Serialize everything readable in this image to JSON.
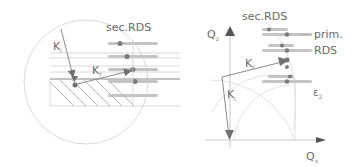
{
  "diagram": {
    "left_panel": {
      "label_sec_rds": "sec.RDS",
      "vector_ki": {
        "symbol": "K",
        "subscript": "i"
      },
      "vector_kf": {
        "symbol": "K",
        "subscript": "f"
      }
    },
    "right_panel": {
      "label_sec_rds": "sec.RDS",
      "label_prim": "prim.",
      "label_rds": "RDS",
      "axis_vertical": {
        "symbol": "Q",
        "subscript": "z"
      },
      "axis_horizontal": {
        "symbol": "Q",
        "subscript": "x"
      },
      "vector_ki": {
        "symbol": "K",
        "subscript": "i"
      },
      "vector_kf": {
        "symbol": "K",
        "subscript": "f"
      },
      "epsilon_label": {
        "symbol": "ε",
        "subscript": "2"
      }
    },
    "colors": {
      "line": "#9a9a9a",
      "light_line": "#d6d6d6",
      "arrow": "#707070",
      "streak": "#c4c4c4",
      "dot": "#7a7a7a",
      "text": "#6a6a6a"
    }
  }
}
